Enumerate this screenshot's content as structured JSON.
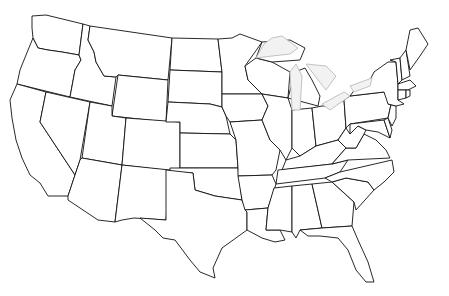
{
  "map": {
    "title": "United States outline map",
    "style": "blank outline, no labels",
    "colors": {
      "background": "#ffffff",
      "border": "#111111",
      "lakes_fill": "#f2f2f2",
      "lakes_stroke": "#bbbbbb"
    },
    "features": [
      "contiguous 48 states",
      "Great Lakes"
    ]
  }
}
